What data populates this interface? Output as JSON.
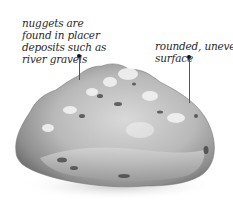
{
  "annotations": [
    {
      "id": "placer",
      "lines": [
        "nuggets are",
        "found in placer",
        "deposits such as",
        "river gravels"
      ]
    },
    {
      "id": "surface",
      "lines": [
        "rounded, uneven",
        "surface"
      ]
    }
  ],
  "colors": {
    "text": "#2a2a2a",
    "leader": "#111111",
    "nugget_light": "#e8e8e8",
    "nugget_mid": "#b5b5b5",
    "nugget_dark": "#4a4a4a"
  }
}
